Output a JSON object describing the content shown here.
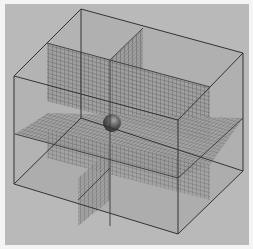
{
  "figure": {
    "colors": {
      "page_border": "#f4f4f4",
      "background": "#b9b9b9",
      "box_edge": "#3a3a3a",
      "mesh_line": "#555555",
      "face_shade": "#a8a8a8",
      "sphere_dark": "#3c3c3c",
      "sphere_light": "#9a9a9a"
    },
    "box": {
      "back_top_left": [
        81,
        9
      ],
      "back_top_right": [
        243,
        53
      ],
      "front_top_left": [
        14,
        76
      ],
      "front_top_right": [
        178,
        120
      ],
      "back_bottom_left": [
        81,
        118
      ],
      "back_bottom_right": [
        243,
        171
      ],
      "front_bottom_left": [
        14,
        184
      ],
      "front_bottom_right": [
        178,
        234
      ]
    },
    "planes": [
      {
        "name": "vertical-plane-front-parallel",
        "grid": "mesh"
      },
      {
        "name": "vertical-plane-side-parallel",
        "grid": "mesh"
      },
      {
        "name": "horizontal-plane-mid",
        "grid": "mesh"
      }
    ],
    "sphere": {
      "cx": 112,
      "cy": 123,
      "r": 9
    }
  }
}
